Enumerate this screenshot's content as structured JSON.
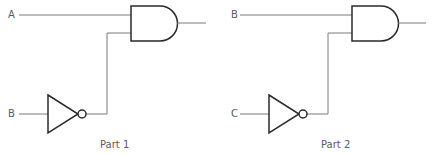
{
  "diagram": {
    "type": "logic-circuits",
    "parts": [
      {
        "caption": "Part 1",
        "inputs": [
          "A",
          "B"
        ],
        "gates": [
          "NOT on B",
          "AND(A, NOT B)"
        ]
      },
      {
        "caption": "Part 2",
        "inputs": [
          "B",
          "C"
        ],
        "gates": [
          "NOT on C",
          "AND(B, NOT C)"
        ]
      }
    ]
  }
}
